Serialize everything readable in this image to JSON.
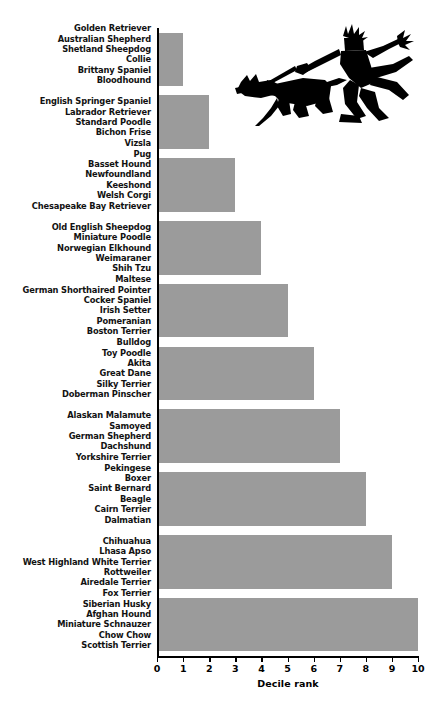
{
  "chart_data": {
    "type": "bar",
    "orientation": "horizontal",
    "title": "",
    "xlabel": "Decile rank",
    "ylabel": "",
    "xlim": [
      0,
      10
    ],
    "xticks": [
      0,
      1,
      2,
      3,
      4,
      5,
      6,
      7,
      8,
      9,
      10
    ],
    "grid": false,
    "legend": null,
    "bar_color": "#9b9b9b",
    "categories": [
      "Golden Retriever; Australian Shepherd; Shetland Sheepdog; Collie; Brittany Spaniel; Bloodhound",
      "English Springer Spaniel; Labrador Retriever; Standard Poodle; Bichon Frise; Vizsla",
      "Pug; Basset Hound; Newfoundland; Keeshond; Welsh Corgi; Chesapeake Bay Retriever",
      "Old English Sheepdog; Miniature Poodle; Norwegian Elkhound; Weimaraner; Shih Tzu",
      "Maltese; German Shorthaired Pointer; Cocker Spaniel; Irish Setter; Pomeranian; Boston Terrier",
      "Bulldog; Toy Poodle; Akita; Great Dane; Silky Terrier; Doberman Pinscher",
      "Alaskan Malamute; Samoyed; German Shepherd; Dachshund; Yorkshire Terrier",
      "Pekingese; Boxer; Saint Bernard; Beagle; Cairn Terrier; Dalmatian",
      "Chihuahua; Lhasa Apso; West Highland White Terrier; Rottweiler; Airedale Terrier",
      "Fox Terrier; Siberian Husky; Afghan Hound; Miniature Schnauzer; Chow Chow; Scottish Terrier"
    ],
    "values": [
      1,
      2,
      3,
      4,
      5,
      6,
      7,
      8,
      9,
      10
    ]
  },
  "axis": {
    "tick_labels": [
      "0",
      "1",
      "2",
      "3",
      "4",
      "5",
      "6",
      "7",
      "8",
      "9",
      "10"
    ],
    "x_title": "Decile rank"
  },
  "groups": [
    {
      "value": 1,
      "breeds": [
        "Golden Retriever",
        "Australian Shepherd",
        "Shetland Sheepdog",
        "Collie",
        "Brittany Spaniel",
        "Bloodhound"
      ]
    },
    {
      "value": 2,
      "breeds": [
        "English Springer Spaniel",
        "Labrador Retriever",
        "Standard Poodle",
        "Bichon Frise",
        "Vizsla"
      ]
    },
    {
      "value": 3,
      "breeds": [
        "Pug",
        "Basset Hound",
        "Newfoundland",
        "Keeshond",
        "Welsh Corgi",
        "Chesapeake Bay Retriever"
      ]
    },
    {
      "value": 4,
      "breeds": [
        "Old English Sheepdog",
        "Miniature Poodle",
        "Norwegian Elkhound",
        "Weimaraner",
        "Shih Tzu"
      ]
    },
    {
      "value": 5,
      "breeds": [
        "Maltese",
        "German Shorthaired Pointer",
        "Cocker Spaniel",
        "Irish Setter",
        "Pomeranian",
        "Boston Terrier"
      ]
    },
    {
      "value": 6,
      "breeds": [
        "Bulldog",
        "Toy Poodle",
        "Akita",
        "Great Dane",
        "Silky Terrier",
        "Doberman Pinscher"
      ]
    },
    {
      "value": 7,
      "breeds": [
        "Alaskan Malamute",
        "Samoyed",
        "German Shepherd",
        "Dachshund",
        "Yorkshire Terrier"
      ]
    },
    {
      "value": 8,
      "breeds": [
        "Pekingese",
        "Boxer",
        "Saint Bernard",
        "Beagle",
        "Cairn Terrier",
        "Dalmatian"
      ]
    },
    {
      "value": 9,
      "breeds": [
        "Chihuahua",
        "Lhasa Apso",
        "West Highland White Terrier",
        "Rottweiler",
        "Airedale Terrier"
      ]
    },
    {
      "value": 10,
      "breeds": [
        "Fox Terrier",
        "Siberian Husky",
        "Afghan Hound",
        "Miniature Schnauzer",
        "Chow Chow",
        "Scottish Terrier"
      ]
    }
  ],
  "illustration": {
    "name": "dog-walker-silhouette",
    "color": "#000000"
  }
}
